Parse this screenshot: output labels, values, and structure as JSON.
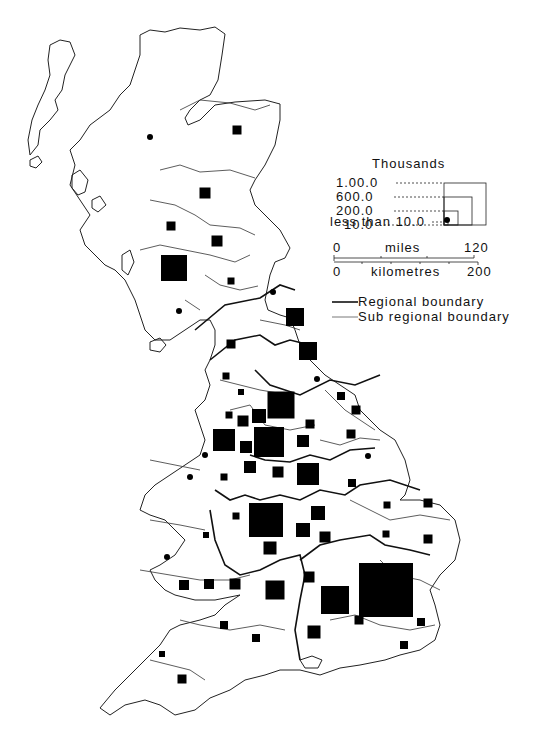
{
  "legend": {
    "title": "Thousands",
    "sizes": [
      {
        "label": "1.00.0",
        "value": 1000,
        "side": 42
      },
      {
        "label": "600.0",
        "value": 600,
        "side": 28
      },
      {
        "label": "200.0",
        "value": 200,
        "side": 14
      },
      {
        "label": "10.0",
        "value": 10,
        "side": 4
      }
    ],
    "dot_label": "less than 10.0",
    "scale": {
      "miles_label": "miles",
      "miles_start": "0",
      "miles_end": "120",
      "km_label": "kilometres",
      "km_start": "0",
      "km_end": "200"
    },
    "regional_boundary": "Regional boundary",
    "subregional_boundary": "Sub regional boundary"
  },
  "symbols": [
    {
      "type": "square",
      "x": 237,
      "y": 130,
      "s": 9
    },
    {
      "type": "dot",
      "x": 150,
      "y": 137,
      "s": 6
    },
    {
      "type": "square",
      "x": 205,
      "y": 193,
      "s": 11
    },
    {
      "type": "square",
      "x": 171,
      "y": 226,
      "s": 9
    },
    {
      "type": "square",
      "x": 217,
      "y": 241,
      "s": 11
    },
    {
      "type": "square",
      "x": 174,
      "y": 268,
      "s": 26
    },
    {
      "type": "square",
      "x": 231,
      "y": 281,
      "s": 7
    },
    {
      "type": "dot",
      "x": 273,
      "y": 292,
      "s": 6
    },
    {
      "type": "dot",
      "x": 179,
      "y": 311,
      "s": 6
    },
    {
      "type": "square",
      "x": 295,
      "y": 317,
      "s": 18
    },
    {
      "type": "square",
      "x": 231,
      "y": 344,
      "s": 9
    },
    {
      "type": "square",
      "x": 308,
      "y": 351,
      "s": 18
    },
    {
      "type": "square",
      "x": 226,
      "y": 376,
      "s": 7
    },
    {
      "type": "dot",
      "x": 317,
      "y": 379,
      "s": 6
    },
    {
      "type": "square",
      "x": 241,
      "y": 392,
      "s": 6
    },
    {
      "type": "square",
      "x": 281,
      "y": 405,
      "s": 27
    },
    {
      "type": "square",
      "x": 341,
      "y": 396,
      "s": 8
    },
    {
      "type": "square",
      "x": 229,
      "y": 415,
      "s": 7
    },
    {
      "type": "square",
      "x": 243,
      "y": 421,
      "s": 11
    },
    {
      "type": "square",
      "x": 259,
      "y": 416,
      "s": 14
    },
    {
      "type": "square",
      "x": 356,
      "y": 410,
      "s": 9
    },
    {
      "type": "square",
      "x": 310,
      "y": 424,
      "s": 9
    },
    {
      "type": "square",
      "x": 224,
      "y": 440,
      "s": 22
    },
    {
      "type": "square",
      "x": 269,
      "y": 442,
      "s": 30
    },
    {
      "type": "square",
      "x": 246,
      "y": 446,
      "s": 7
    },
    {
      "type": "square",
      "x": 303,
      "y": 441,
      "s": 12
    },
    {
      "type": "square",
      "x": 351,
      "y": 434,
      "s": 9
    },
    {
      "type": "square",
      "x": 246,
      "y": 447,
      "s": 12
    },
    {
      "type": "dot",
      "x": 205,
      "y": 455,
      "s": 6
    },
    {
      "type": "dot",
      "x": 368,
      "y": 456,
      "s": 6
    },
    {
      "type": "square",
      "x": 250,
      "y": 467,
      "s": 12
    },
    {
      "type": "square",
      "x": 278,
      "y": 472,
      "s": 11
    },
    {
      "type": "square",
      "x": 308,
      "y": 474,
      "s": 22
    },
    {
      "type": "dot",
      "x": 190,
      "y": 477,
      "s": 6
    },
    {
      "type": "square",
      "x": 224,
      "y": 477,
      "s": 7
    },
    {
      "type": "square",
      "x": 352,
      "y": 483,
      "s": 8
    },
    {
      "type": "square",
      "x": 428,
      "y": 503,
      "s": 9
    },
    {
      "type": "square",
      "x": 236,
      "y": 516,
      "s": 7
    },
    {
      "type": "square",
      "x": 266,
      "y": 520,
      "s": 34
    },
    {
      "type": "square",
      "x": 303,
      "y": 530,
      "s": 14
    },
    {
      "type": "square",
      "x": 318,
      "y": 513,
      "s": 14
    },
    {
      "type": "square",
      "x": 387,
      "y": 505,
      "s": 7
    },
    {
      "type": "square",
      "x": 386,
      "y": 534,
      "s": 7
    },
    {
      "type": "square",
      "x": 428,
      "y": 539,
      "s": 9
    },
    {
      "type": "square",
      "x": 206,
      "y": 535,
      "s": 6
    },
    {
      "type": "dot",
      "x": 167,
      "y": 557,
      "s": 6
    },
    {
      "type": "square",
      "x": 325,
      "y": 537,
      "s": 11
    },
    {
      "type": "square",
      "x": 270,
      "y": 548,
      "s": 13
    },
    {
      "type": "square",
      "x": 399,
      "y": 575,
      "s": 9
    },
    {
      "type": "square",
      "x": 309,
      "y": 577,
      "s": 11
    },
    {
      "type": "square",
      "x": 184,
      "y": 585,
      "s": 10
    },
    {
      "type": "square",
      "x": 209,
      "y": 584,
      "s": 10
    },
    {
      "type": "square",
      "x": 235,
      "y": 584,
      "s": 11
    },
    {
      "type": "square",
      "x": 275,
      "y": 590,
      "s": 19
    },
    {
      "type": "square",
      "x": 335,
      "y": 600,
      "s": 28
    },
    {
      "type": "square",
      "x": 386,
      "y": 590,
      "s": 54
    },
    {
      "type": "square",
      "x": 421,
      "y": 622,
      "s": 8
    },
    {
      "type": "square",
      "x": 404,
      "y": 645,
      "s": 8
    },
    {
      "type": "square",
      "x": 359,
      "y": 620,
      "s": 9
    },
    {
      "type": "square",
      "x": 314,
      "y": 632,
      "s": 13
    },
    {
      "type": "square",
      "x": 256,
      "y": 638,
      "s": 8
    },
    {
      "type": "square",
      "x": 224,
      "y": 625,
      "s": 8
    },
    {
      "type": "square",
      "x": 162,
      "y": 654,
      "s": 6
    },
    {
      "type": "square",
      "x": 182,
      "y": 679,
      "s": 9
    }
  ]
}
